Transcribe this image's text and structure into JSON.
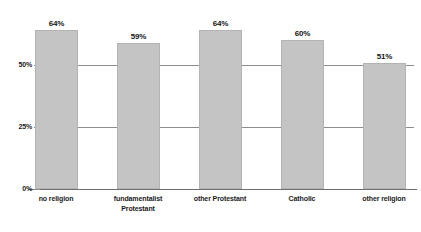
{
  "chart_data": {
    "type": "bar",
    "title": "",
    "subtitle": "",
    "xlabel": "",
    "ylabel": "",
    "categories": [
      "no religion",
      "fundamentalist Protestant",
      "other Protestant",
      "Catholic",
      "other religion"
    ],
    "category_lines": [
      [
        "no religion"
      ],
      [
        "fundamentalist",
        "Protestant"
      ],
      [
        "other Protestant"
      ],
      [
        "Catholic"
      ],
      [
        "other religion"
      ]
    ],
    "values": [
      64,
      59,
      64,
      60,
      51
    ],
    "value_labels": [
      "64%",
      "59%",
      "64%",
      "60%",
      "51%"
    ],
    "ylim": [
      0,
      75
    ],
    "yticks": [
      0,
      25,
      50
    ],
    "ytick_labels": [
      "0%",
      "25%",
      "50%"
    ],
    "grid": true,
    "gridlines_at": [
      25,
      50
    ],
    "legend": "none",
    "bar_color": "#c4c4c4",
    "bar_border_color": "#b3b3b3",
    "axis_color": "#6f6f6f",
    "grid_color": "#8d8d8d",
    "background_color": "#ffffff",
    "text_color": "#1a1a1a"
  },
  "axis": {
    "ytick_50": "50%",
    "ytick_25": "25%",
    "ytick_0": "0%"
  },
  "bars": [
    {
      "label": "no religion",
      "value_label": "64%"
    },
    {
      "label": "fundamentalist Protestant",
      "value_label": "59%"
    },
    {
      "label": "other Protestant",
      "value_label": "64%"
    },
    {
      "label": "Catholic",
      "value_label": "60%"
    },
    {
      "label": "other religion",
      "value_label": "51%"
    }
  ],
  "categories_text": {
    "c0_l0": "no religion",
    "c1_l0": "fundamentalist",
    "c1_l1": "Protestant",
    "c2_l0": "other Protestant",
    "c3_l0": "Catholic",
    "c4_l0": "other religion"
  }
}
